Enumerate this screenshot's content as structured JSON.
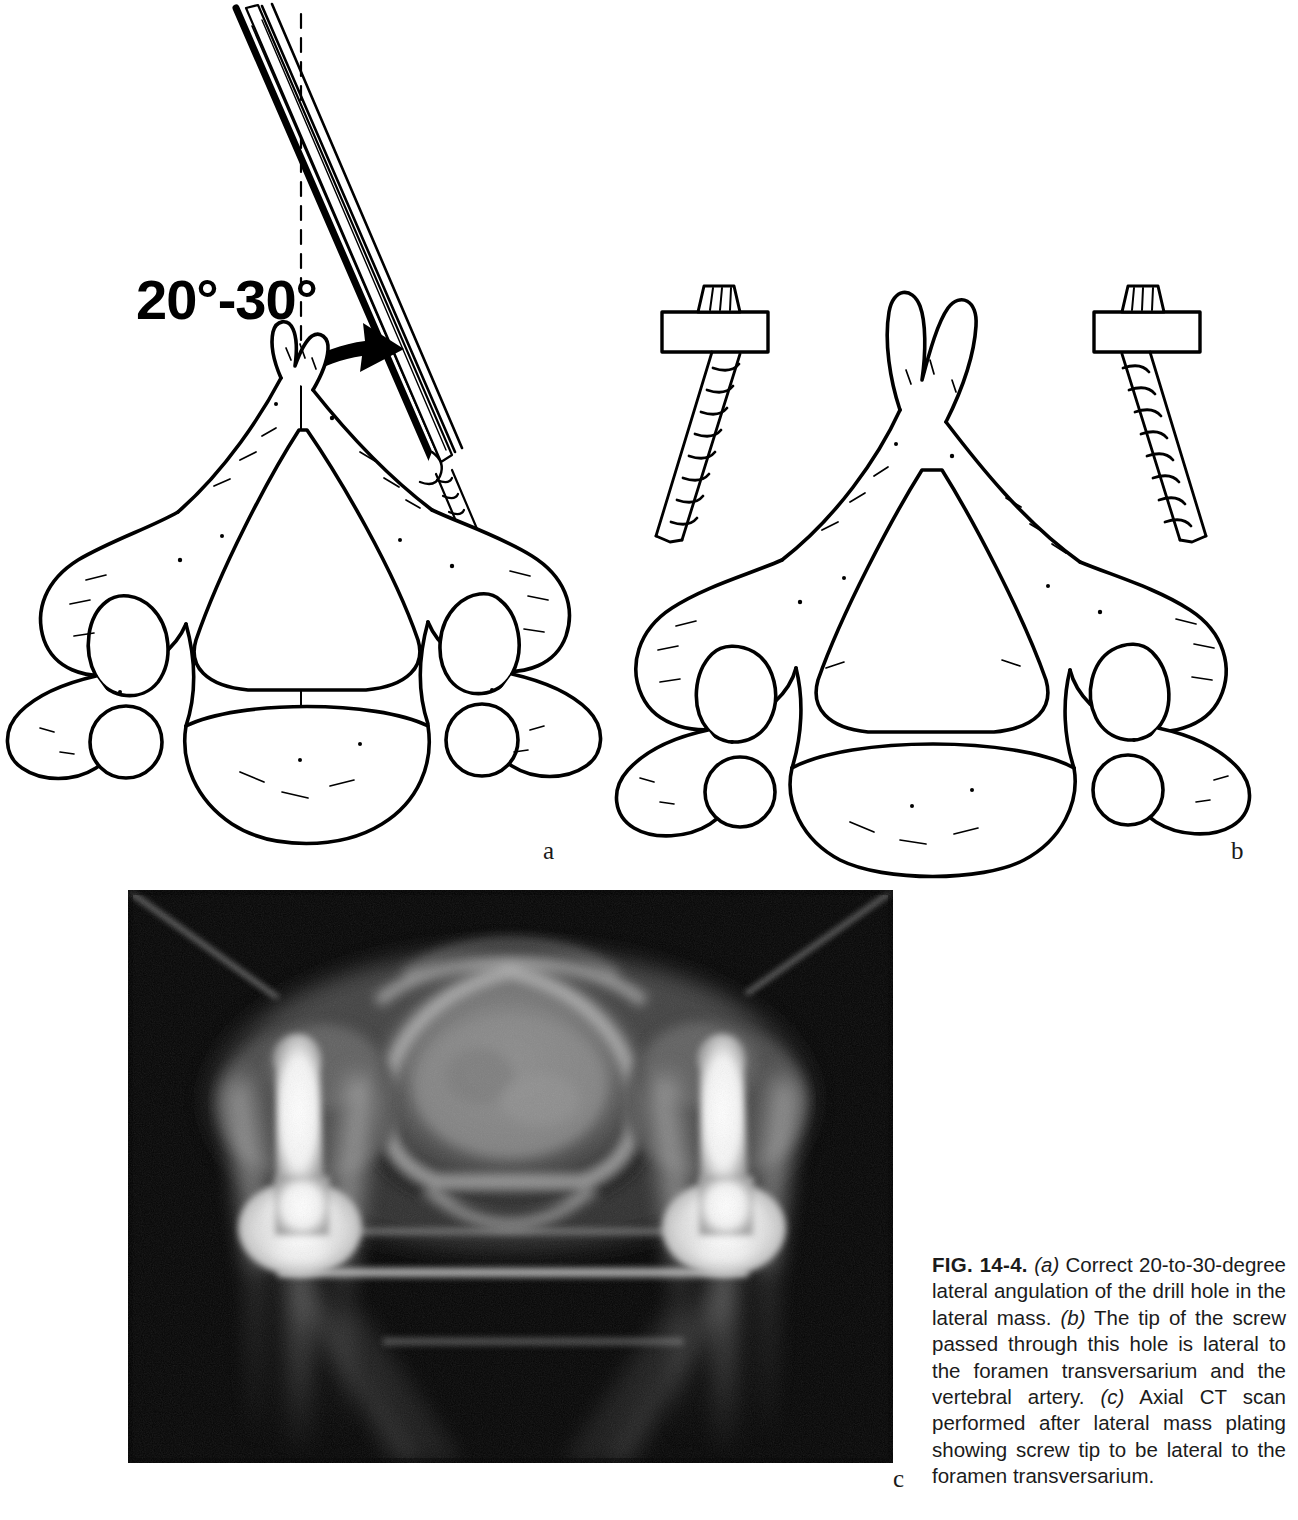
{
  "figure": {
    "number": "FIG. 14-4.",
    "panel_letters": {
      "a": "a",
      "b": "b",
      "c": "c"
    },
    "artist_signature": "T. G. Huff"
  },
  "panel_a": {
    "angle_value": "20",
    "angle_range_value": "30",
    "angle_label": "20°-30°",
    "degree_symbol": "°",
    "separator": "-",
    "anatomy": "axial view of cervical vertebra",
    "instrument": "surgical drill with fluted bit",
    "midline": "dashed vertical midline reference",
    "arrow": "curved arrow indicating lateral angulation"
  },
  "panel_b": {
    "anatomy": "axial view of cervical vertebra with lateral mass screws",
    "hardware": "bilateral lateral mass plates and screws",
    "screw_count": 2
  },
  "panel_c": {
    "modality": "Axial CT scan",
    "findings": "bilateral bright metallic screw artifacts lateral to foramen transversarium"
  },
  "caption": {
    "fig_label": "FIG. 14-4.",
    "ref_a": "(a)",
    "text_a": " Correct 20-to-30-degree lateral angulation of the drill hole in the lateral mass. ",
    "ref_b": "(b)",
    "text_b": " The tip of the screw passed through this hole is lateral to the foramen transversarium and the vertebral artery. ",
    "ref_c": "(c)",
    "text_c": " Axial CT scan performed after lateral mass plating showing screw tip to be lateral to the foramen transversarium."
  },
  "colors": {
    "page_background": "#ffffff",
    "ink": "#000000",
    "caption_text": "#1b1b1b",
    "ct_background": "#050505",
    "ct_bone": "#8c8c8c",
    "ct_metal": "#ffffff"
  }
}
